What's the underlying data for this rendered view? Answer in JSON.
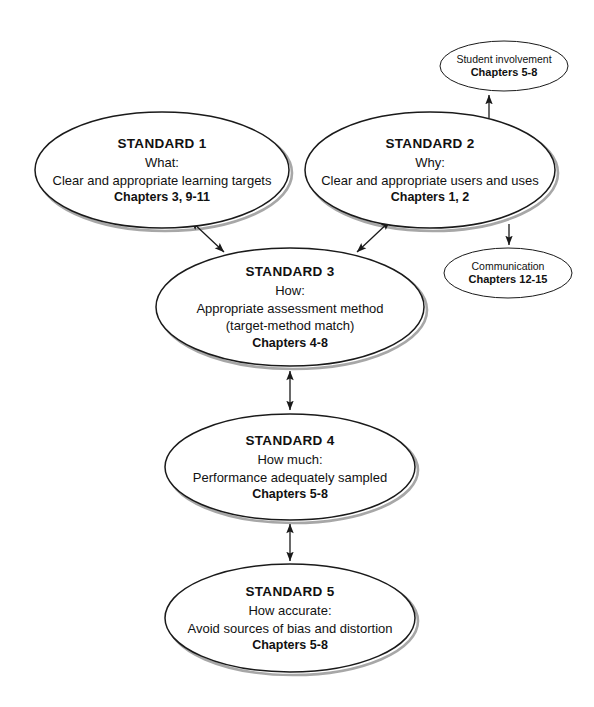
{
  "diagram": {
    "background_color": "#ffffff",
    "stroke_color": "#1a1a1a",
    "shadow_color": "#8a8a8a",
    "nodes": [
      {
        "id": "standard-1",
        "kind": "standard",
        "title": "STANDARD 1",
        "question": "What:",
        "description": "Clear and appropriate learning targets",
        "description2": "",
        "chapters": "Chapters 3, 9-11",
        "cx": 162,
        "cy": 170,
        "rx": 127,
        "ry": 58
      },
      {
        "id": "standard-2",
        "kind": "standard",
        "title": "STANDARD 2",
        "question": "Why:",
        "description": "Clear and appropriate users and uses",
        "description2": "",
        "chapters": "Chapters 1, 2",
        "cx": 430,
        "cy": 170,
        "rx": 125,
        "ry": 58
      },
      {
        "id": "standard-3",
        "kind": "standard",
        "title": "STANDARD 3",
        "question": "How:",
        "description": "Appropriate assessment method",
        "description2": "(target-method match)",
        "chapters": "Chapters 4-8",
        "cx": 290,
        "cy": 307,
        "rx": 134,
        "ry": 59
      },
      {
        "id": "standard-4",
        "kind": "standard",
        "title": "STANDARD 4",
        "question": "How much:",
        "description": "Performance adequately sampled",
        "description2": "",
        "chapters": "Chapters 5-8",
        "cx": 290,
        "cy": 467,
        "rx": 125,
        "ry": 53
      },
      {
        "id": "standard-5",
        "kind": "standard",
        "title": "STANDARD 5",
        "question": "How accurate:",
        "description": "Avoid sources of bias and distortion",
        "description2": "",
        "chapters": "Chapters 5-8",
        "cx": 290,
        "cy": 618,
        "rx": 125,
        "ry": 54
      },
      {
        "id": "student-involvement",
        "kind": "satellite",
        "title": "Student involvement",
        "chapters": "Chapters 5-8",
        "cx": 504,
        "cy": 66,
        "rx": 64,
        "ry": 25
      },
      {
        "id": "communication",
        "kind": "satellite",
        "title": "Communication",
        "chapters": "Chapters 12-15",
        "cx": 508,
        "cy": 273,
        "rx": 64,
        "ry": 25
      }
    ],
    "connectors": [
      {
        "id": "s1-to-s3",
        "from": "standard-1",
        "to": "standard-3",
        "style": "double-arrow",
        "x1": 191,
        "y1": 221,
        "x2": 224,
        "y2": 252
      },
      {
        "id": "s3-to-s2",
        "from": "standard-3",
        "to": "standard-2",
        "style": "double-arrow",
        "x1": 357,
        "y1": 252,
        "x2": 390,
        "y2": 221
      },
      {
        "id": "s3-to-s4",
        "from": "standard-3",
        "to": "standard-4",
        "style": "double-arrow",
        "x1": 290,
        "y1": 371,
        "x2": 290,
        "y2": 410
      },
      {
        "id": "s4-to-s5",
        "from": "standard-4",
        "to": "standard-5",
        "style": "double-arrow",
        "x1": 290,
        "y1": 524,
        "x2": 290,
        "y2": 561
      },
      {
        "id": "s2-to-student-involvement",
        "from": "standard-2",
        "to": "student-involvement",
        "style": "single-arrow",
        "x1": 489,
        "y1": 118,
        "x2": 489,
        "y2": 95
      },
      {
        "id": "s2-to-communication",
        "from": "standard-2",
        "to": "communication",
        "style": "single-arrow",
        "x1": 509,
        "y1": 224,
        "x2": 509,
        "y2": 245
      }
    ]
  }
}
